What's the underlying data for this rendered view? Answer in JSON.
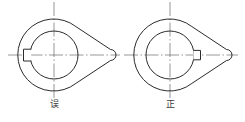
{
  "figure": {
    "type": "engineering-drawing",
    "background_color": "#ffffff",
    "line_color": "#2b2b2b",
    "centerline_color": "#6b6b6b",
    "panels": [
      {
        "id": "wrong",
        "caption": "误",
        "caption_meaning": "wrong",
        "body_outline": {
          "arc_center_x": 54,
          "arc_center_y": 55,
          "arc_radius": 36,
          "tip_x": 113,
          "tip_y": 55
        },
        "bore": {
          "center_x": 54,
          "center_y": 55,
          "radius": 24
        },
        "keyway": {
          "side": "left",
          "width": 7,
          "height": 12,
          "position": "opposite the taper tip"
        },
        "centerlines": {
          "horizontal": {
            "x1": 8,
            "x2": 120,
            "y": 55
          },
          "vertical": {
            "y1": 2,
            "y2": 98,
            "x": 54
          }
        }
      },
      {
        "id": "correct",
        "caption": "正",
        "caption_meaning": "correct",
        "body_outline": {
          "arc_center_x": 170,
          "arc_center_y": 55,
          "arc_radius": 36,
          "tip_x": 229,
          "tip_y": 55
        },
        "bore": {
          "center_x": 170,
          "center_y": 55,
          "radius": 24
        },
        "keyway": {
          "side": "right",
          "width": 7,
          "height": 10,
          "position": "toward the taper tip"
        },
        "centerlines": {
          "horizontal": {
            "x1": 124,
            "x2": 238,
            "y": 55
          },
          "vertical": {
            "y1": 2,
            "y2": 98,
            "x": 170
          }
        }
      }
    ]
  }
}
